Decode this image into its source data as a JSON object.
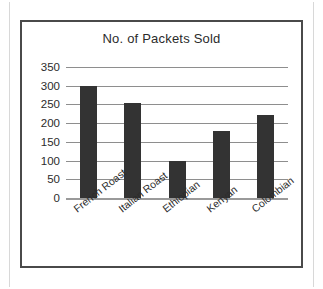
{
  "chart_data": {
    "type": "bar",
    "title": "No. of Packets Sold",
    "xlabel": "",
    "ylabel": "",
    "categories": [
      "French Roast",
      "Italian Roast",
      "Ethiopian",
      "Kenyan",
      "Colombian"
    ],
    "values": [
      300,
      255,
      100,
      178,
      222
    ],
    "ylim": [
      0,
      350
    ],
    "yticks": [
      0,
      50,
      100,
      150,
      200,
      250,
      300,
      350
    ],
    "ytick_labels": [
      "0",
      "50",
      "100",
      "150",
      "200",
      "250",
      "300",
      "350"
    ],
    "grid": true,
    "legend": false,
    "bar_color": "#333333",
    "gridline_color": "#8e8e8e",
    "frame_color": "#4a4a4a",
    "text_color": "#2b2b2b",
    "background": "#ffffff",
    "xtick_rotation": -38
  }
}
